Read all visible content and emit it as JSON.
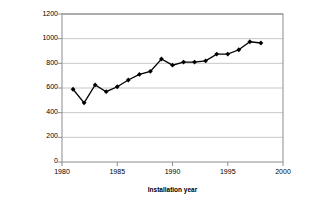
{
  "chart_data": {
    "type": "line",
    "title": "",
    "xlabel": "Installation year",
    "ylabel": "Productivity [kWh/m2]",
    "xlim": [
      1980,
      2000
    ],
    "ylim": [
      0,
      1200
    ],
    "xticks": [
      1980,
      1985,
      1990,
      1995,
      2000
    ],
    "yticks": [
      0,
      200,
      400,
      600,
      800,
      1000,
      1200
    ],
    "grid": "horizontal",
    "legend": "none",
    "marker": "diamond",
    "series_color": "#000000",
    "x": [
      1981,
      1982,
      1983,
      1984,
      1985,
      1986,
      1987,
      1988,
      1989,
      1990,
      1991,
      1992,
      1993,
      1994,
      1995,
      1996,
      1997,
      1998
    ],
    "values": [
      590,
      480,
      625,
      570,
      610,
      665,
      710,
      735,
      835,
      785,
      810,
      810,
      820,
      875,
      875,
      910,
      975,
      965
    ],
    "series": [
      {
        "name": "Productivity",
        "values": [
          590,
          480,
          625,
          570,
          610,
          665,
          710,
          735,
          835,
          785,
          810,
          810,
          820,
          875,
          875,
          910,
          975,
          965
        ]
      }
    ]
  },
  "axis": {
    "y_title": "Productivity [kWh/m2]",
    "x_title": "Installation year",
    "y_tick_labels": [
      "1200",
      "1000",
      "800",
      "600",
      "400",
      "200",
      "0"
    ],
    "x_tick_labels": [
      "1980",
      "1985",
      "1990",
      "1995",
      "2000"
    ]
  },
  "colors": {
    "series": "#000000",
    "grid": "#c8c8c8",
    "frame": "#808080",
    "background": "#ffffff"
  }
}
